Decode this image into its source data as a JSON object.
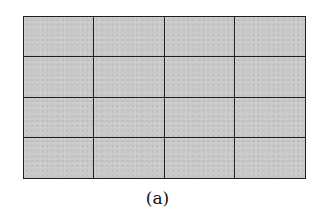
{
  "figure": {
    "caption": "(a)",
    "grid": {
      "rows": 4,
      "columns": 4,
      "cell_fill_color": "#c9c9c9",
      "line_color": "#1e1e1e"
    }
  }
}
